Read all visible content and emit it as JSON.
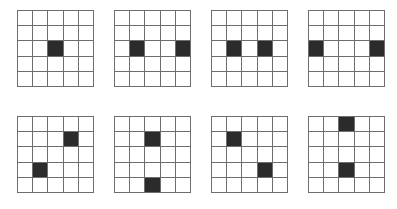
{
  "figure": {
    "grid_size": 5,
    "rows_of_grids": 2,
    "grids_per_row": 4,
    "colors": {
      "background": "#ffffff",
      "grid_line": "#6e6e6e",
      "filled_cell": "#2b2b2b",
      "empty_cell": "#ffffff"
    }
  },
  "chart_data": {
    "type": "heatmap",
    "xlabel": "",
    "ylabel": "",
    "grid_rows": 5,
    "grid_cols": 5,
    "filled_value": 1,
    "empty_value": 0,
    "panels": [
      {
        "index": 1,
        "name": "grid-1",
        "position": "top-row-1",
        "filled_cells": [
          [
            3,
            3
          ]
        ],
        "matrix": [
          [
            0,
            0,
            0,
            0,
            0
          ],
          [
            0,
            0,
            0,
            0,
            0
          ],
          [
            0,
            0,
            1,
            0,
            0
          ],
          [
            0,
            0,
            0,
            0,
            0
          ],
          [
            0,
            0,
            0,
            0,
            0
          ]
        ]
      },
      {
        "index": 2,
        "name": "grid-2",
        "position": "top-row-2",
        "filled_cells": [
          [
            3,
            2
          ],
          [
            3,
            5
          ]
        ],
        "matrix": [
          [
            0,
            0,
            0,
            0,
            0
          ],
          [
            0,
            0,
            0,
            0,
            0
          ],
          [
            0,
            1,
            0,
            0,
            1
          ],
          [
            0,
            0,
            0,
            0,
            0
          ],
          [
            0,
            0,
            0,
            0,
            0
          ]
        ]
      },
      {
        "index": 3,
        "name": "grid-3",
        "position": "top-row-3",
        "filled_cells": [
          [
            3,
            2
          ],
          [
            3,
            4
          ]
        ],
        "matrix": [
          [
            0,
            0,
            0,
            0,
            0
          ],
          [
            0,
            0,
            0,
            0,
            0
          ],
          [
            0,
            1,
            0,
            1,
            0
          ],
          [
            0,
            0,
            0,
            0,
            0
          ],
          [
            0,
            0,
            0,
            0,
            0
          ]
        ]
      },
      {
        "index": 4,
        "name": "grid-4",
        "position": "top-row-4",
        "filled_cells": [
          [
            3,
            1
          ],
          [
            3,
            5
          ]
        ],
        "matrix": [
          [
            0,
            0,
            0,
            0,
            0
          ],
          [
            0,
            0,
            0,
            0,
            0
          ],
          [
            1,
            0,
            0,
            0,
            1
          ],
          [
            0,
            0,
            0,
            0,
            0
          ],
          [
            0,
            0,
            0,
            0,
            0
          ]
        ]
      },
      {
        "index": 5,
        "name": "grid-5",
        "position": "bottom-row-1",
        "filled_cells": [
          [
            2,
            4
          ],
          [
            4,
            2
          ]
        ],
        "matrix": [
          [
            0,
            0,
            0,
            0,
            0
          ],
          [
            0,
            0,
            0,
            1,
            0
          ],
          [
            0,
            0,
            0,
            0,
            0
          ],
          [
            0,
            1,
            0,
            0,
            0
          ],
          [
            0,
            0,
            0,
            0,
            0
          ]
        ]
      },
      {
        "index": 6,
        "name": "grid-6",
        "position": "bottom-row-2",
        "filled_cells": [
          [
            2,
            3
          ],
          [
            5,
            3
          ]
        ],
        "matrix": [
          [
            0,
            0,
            0,
            0,
            0
          ],
          [
            0,
            0,
            1,
            0,
            0
          ],
          [
            0,
            0,
            0,
            0,
            0
          ],
          [
            0,
            0,
            0,
            0,
            0
          ],
          [
            0,
            0,
            1,
            0,
            0
          ]
        ]
      },
      {
        "index": 7,
        "name": "grid-7",
        "position": "bottom-row-3",
        "filled_cells": [
          [
            2,
            2
          ],
          [
            4,
            4
          ]
        ],
        "matrix": [
          [
            0,
            0,
            0,
            0,
            0
          ],
          [
            0,
            1,
            0,
            0,
            0
          ],
          [
            0,
            0,
            0,
            0,
            0
          ],
          [
            0,
            0,
            0,
            1,
            0
          ],
          [
            0,
            0,
            0,
            0,
            0
          ]
        ]
      },
      {
        "index": 8,
        "name": "grid-8",
        "position": "bottom-row-4",
        "filled_cells": [
          [
            1,
            3
          ],
          [
            4,
            3
          ]
        ],
        "matrix": [
          [
            0,
            0,
            1,
            0,
            0
          ],
          [
            0,
            0,
            0,
            0,
            0
          ],
          [
            0,
            0,
            0,
            0,
            0
          ],
          [
            0,
            0,
            1,
            0,
            0
          ],
          [
            0,
            0,
            0,
            0,
            0
          ]
        ]
      }
    ]
  }
}
